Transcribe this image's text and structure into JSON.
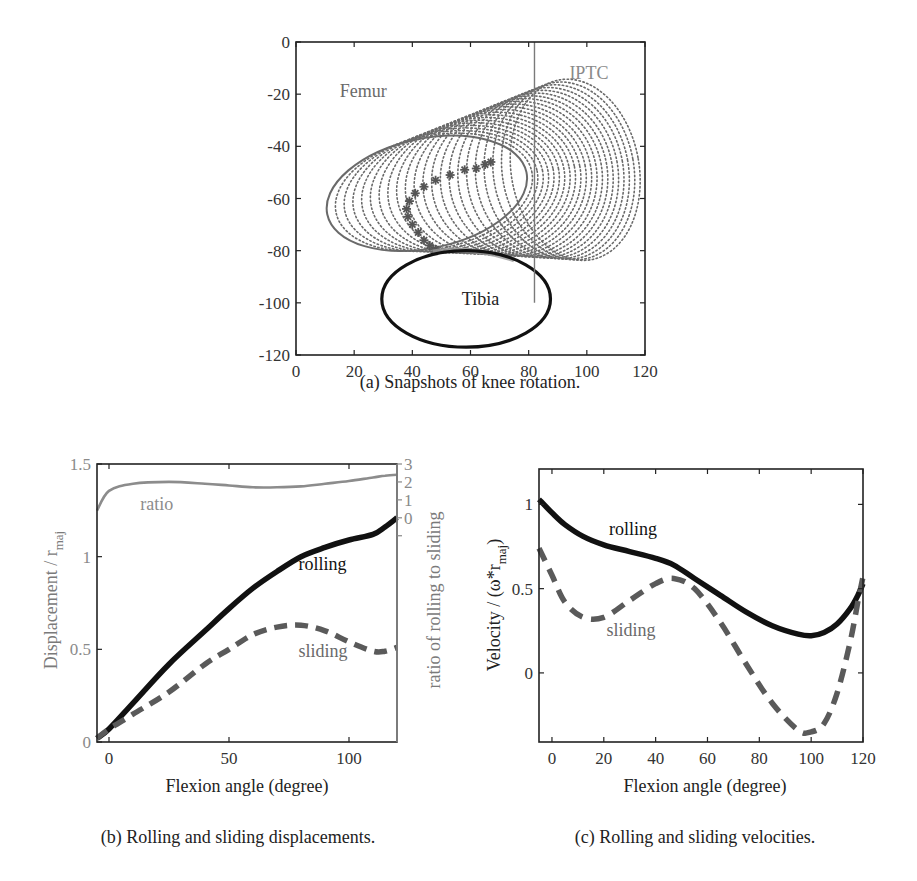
{
  "figure": {
    "caption_a": "(a) Snapshots of knee rotation.",
    "caption_b": "(b) Rolling and sliding displacements.",
    "caption_c": "(c)  Rolling and sliding velocities."
  },
  "colors": {
    "rolling": "#111111",
    "sliding": "#5a5a5a",
    "ratio": "#8c8c8c",
    "femur_dots": "#6a6a6a",
    "tibia": "#111111",
    "iptc": "#7a7a7a",
    "axis": "#222222"
  },
  "chart_data": [
    {
      "id": "a",
      "type": "scatter",
      "title": "Snapshots of knee rotation",
      "xlabel": "",
      "ylabel": "",
      "xlim": [
        0,
        120
      ],
      "ylim": [
        -120,
        0
      ],
      "xticks": [
        0,
        20,
        40,
        60,
        80,
        100,
        120
      ],
      "yticks": [
        0,
        -20,
        -40,
        -60,
        -80,
        -100,
        -120
      ],
      "annotations": [
        {
          "text": "Femur",
          "x": 15,
          "y": -21
        },
        {
          "text": "IPTC",
          "x": 94,
          "y": -14
        },
        {
          "text": "Tibia",
          "x": 57,
          "y": -101
        }
      ],
      "iptc_line": {
        "x": 82,
        "y_from": 0,
        "y_to": -100
      },
      "tibia_ellipse": {
        "cx": 58.5,
        "cy": -98.5,
        "rx": 29,
        "ry": 18.5
      },
      "femur_snapshots": {
        "count": 22,
        "start": {
          "cx": 45,
          "cy": -58,
          "rx": 35,
          "ry": 21,
          "angle": -12
        },
        "end": {
          "cx": 96,
          "cy": -49,
          "rx": 22,
          "ry": 35,
          "angle": -10
        }
      },
      "contact_path_stars": [
        [
          67,
          -46
        ],
        [
          65,
          -47
        ],
        [
          62,
          -48.5
        ],
        [
          58,
          -49
        ],
        [
          53,
          -51
        ],
        [
          48,
          -53
        ],
        [
          44,
          -55.5
        ],
        [
          41,
          -58
        ],
        [
          39,
          -61
        ],
        [
          38,
          -64
        ],
        [
          38.5,
          -67
        ],
        [
          40,
          -70
        ],
        [
          42,
          -73
        ],
        [
          44,
          -76
        ],
        [
          46,
          -78
        ],
        [
          48,
          -79.5
        ]
      ]
    },
    {
      "id": "b",
      "type": "line",
      "title": "Rolling and sliding displacements",
      "xlabel": "Flexion angle (degree)",
      "ylabel": "Displacement / r",
      "ylabel_sub": "maj",
      "ylabel_right": "ratio of rolling to sliding",
      "xlim": [
        -5,
        120
      ],
      "ylim": [
        0,
        1.5
      ],
      "ylim_right": [
        -12.5,
        3
      ],
      "xticks": [
        0,
        50,
        100
      ],
      "yticks": [
        0,
        0.5,
        1,
        1.5
      ],
      "yticks_right": [
        0,
        1,
        2,
        3
      ],
      "grid": false,
      "x": [
        -5,
        0,
        10,
        25,
        40,
        50,
        60,
        70,
        80,
        90,
        100,
        110,
        115,
        120
      ],
      "series": [
        {
          "name": "rolling",
          "style": "solid",
          "axis": "left",
          "values": [
            0.02,
            0.07,
            0.21,
            0.42,
            0.6,
            0.72,
            0.83,
            0.92,
            1.0,
            1.05,
            1.09,
            1.12,
            1.16,
            1.21
          ]
        },
        {
          "name": "sliding",
          "style": "dashed",
          "axis": "left",
          "values": [
            0.02,
            0.07,
            0.15,
            0.27,
            0.42,
            0.5,
            0.58,
            0.62,
            0.63,
            0.6,
            0.54,
            0.49,
            0.49,
            0.51
          ]
        },
        {
          "name": "ratio",
          "style": "solid",
          "axis": "right",
          "values": [
            0.4,
            1.5,
            1.9,
            2.0,
            1.9,
            1.8,
            1.7,
            1.7,
            1.75,
            1.9,
            2.05,
            2.25,
            2.35,
            2.4
          ]
        }
      ],
      "annotations": [
        {
          "text": "ratio",
          "x": 13,
          "y": 1.25,
          "series": "ratio"
        },
        {
          "text": "rolling",
          "x": 79,
          "y": 0.93,
          "series": "rolling"
        },
        {
          "text": "sliding",
          "x": 79,
          "y": 0.46,
          "series": "sliding"
        }
      ]
    },
    {
      "id": "c",
      "type": "line",
      "title": "Rolling and sliding velocities",
      "xlabel": "Flexion angle (degree)",
      "ylabel": "Velocity / (ω*r",
      "ylabel_sub": "maj",
      "ylabel_tail": ")",
      "xlim": [
        -5,
        120
      ],
      "ylim": [
        -0.41,
        1.21
      ],
      "xticks": [
        0,
        20,
        40,
        60,
        80,
        100,
        120
      ],
      "yticks": [
        0,
        0.5,
        1
      ],
      "grid": false,
      "x": [
        -5,
        0,
        5,
        12,
        20,
        30,
        40,
        47,
        55,
        65,
        75,
        85,
        95,
        100,
        105,
        110,
        115,
        118,
        120
      ],
      "series": [
        {
          "name": "rolling",
          "style": "solid",
          "values": [
            1.03,
            0.95,
            0.88,
            0.81,
            0.76,
            0.72,
            0.68,
            0.64,
            0.56,
            0.46,
            0.36,
            0.28,
            0.23,
            0.22,
            0.24,
            0.29,
            0.38,
            0.46,
            0.53
          ]
        },
        {
          "name": "sliding",
          "style": "dashed",
          "values": [
            0.74,
            0.58,
            0.42,
            0.33,
            0.33,
            0.43,
            0.53,
            0.56,
            0.5,
            0.3,
            0.05,
            -0.18,
            -0.34,
            -0.35,
            -0.3,
            -0.12,
            0.18,
            0.42,
            0.57
          ]
        }
      ],
      "annotations": [
        {
          "text": "rolling",
          "x": 22,
          "y": 0.82,
          "series": "rolling"
        },
        {
          "text": "sliding",
          "x": 21,
          "y": 0.22,
          "series": "sliding"
        }
      ]
    }
  ]
}
